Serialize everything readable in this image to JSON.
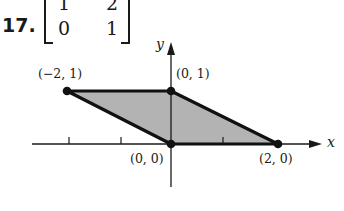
{
  "problem": {
    "number": "17.",
    "matrix": [
      [
        "1",
        "2"
      ],
      [
        "0",
        "1"
      ]
    ]
  },
  "figure": {
    "axes": {
      "x_label": "x",
      "y_label": "y"
    },
    "points": [
      {
        "label": "(−2, 1)",
        "x": -2,
        "y": 1
      },
      {
        "label": "(0, 1)",
        "x": 0,
        "y": 1
      },
      {
        "label": "(0, 0)",
        "x": 0,
        "y": 0
      },
      {
        "label": "(2, 0)",
        "x": 2,
        "y": 0
      }
    ],
    "fill_color": "#b3b3b3",
    "stroke_color": "#111111"
  }
}
